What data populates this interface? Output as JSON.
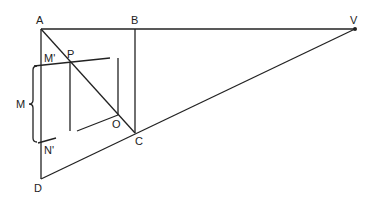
{
  "diagram": {
    "type": "geometric-perspective-construction",
    "points": {
      "A": {
        "label": "A",
        "x": 41,
        "y": 29
      },
      "B": {
        "label": "B",
        "x": 135,
        "y": 29
      },
      "V": {
        "label": "V",
        "x": 355,
        "y": 29
      },
      "C": {
        "label": "C",
        "x": 135,
        "y": 133
      },
      "D": {
        "label": "D",
        "x": 41,
        "y": 179
      },
      "M_prime": {
        "label": "M'",
        "x": 41,
        "y": 66
      },
      "N_prime": {
        "label": "N'",
        "x": 41,
        "y": 142
      },
      "P": {
        "label": "P",
        "x": 70,
        "y": 62
      },
      "O": {
        "label": "O",
        "x": 118,
        "y": 115
      }
    },
    "brace_label": "M",
    "colors": {
      "line": "#222222",
      "background": "#ffffff"
    }
  }
}
